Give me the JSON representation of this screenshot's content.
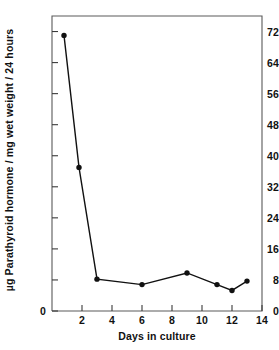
{
  "chart_data": {
    "type": "line",
    "title": "",
    "xlabel": "Days in culture",
    "ylabel": "µg Parathyroid hormone / mg wet weight / 24 hours",
    "xlim": [
      0,
      14
    ],
    "ylim": [
      0,
      76
    ],
    "grid": false,
    "legend": null,
    "marker": "filled-circle",
    "line_color": "#111111",
    "marker_color": "#111111",
    "xticks": [
      0,
      2,
      4,
      6,
      8,
      10,
      12,
      14
    ],
    "xtick_labels": [
      "0",
      "2",
      "4",
      "6",
      "8",
      "10",
      "12",
      "14"
    ],
    "yticks": [
      0,
      8,
      16,
      24,
      32,
      40,
      48,
      56,
      64,
      72
    ],
    "ytick_labels": [
      "0",
      "8",
      "16",
      "24",
      "32",
      "40",
      "48",
      "56",
      "64",
      "72"
    ],
    "series": [
      {
        "name": "Parathyroid hormone secretion",
        "x": [
          0.8,
          1.8,
          3.0,
          6.0,
          9.0,
          11.0,
          12.0,
          13.0
        ],
        "values": [
          71.0,
          37.0,
          8.2,
          6.8,
          9.8,
          6.8,
          5.3,
          7.7
        ]
      }
    ]
  }
}
